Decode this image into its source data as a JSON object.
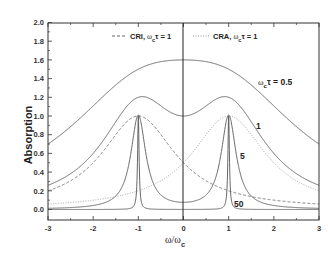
{
  "chart_data": {
    "type": "line",
    "title": "",
    "xlabel": "ω/ω_c",
    "ylabel": "Absorption",
    "xlim": [
      -3,
      3
    ],
    "ylim": [
      -0.1,
      2.0
    ],
    "grid": false,
    "x_ticks": [
      "-3",
      "-2",
      "-1",
      "0",
      "1",
      "2",
      "3"
    ],
    "y_ticks": [
      "0.0",
      "0.2",
      "0.4",
      "0.6",
      "0.8",
      "1.0",
      "1.2",
      "1.4",
      "1.6",
      "1.8",
      "2.0"
    ],
    "legend_position": "top",
    "legend": [
      {
        "label": "CRI, ωcτ = 1",
        "style": "dashed"
      },
      {
        "label": "CRA, ωcτ = 1",
        "style": "dotted"
      }
    ],
    "series": [
      {
        "name": "ωcτ = 0.5",
        "style": "solid",
        "tau": 0.5,
        "x": [
          -3,
          -2,
          -1,
          0,
          1,
          2,
          3
        ],
        "values": [
          0.69,
          1.02,
          1.49,
          1.6,
          1.49,
          1.02,
          0.69
        ]
      },
      {
        "name": "ωcτ = 1",
        "style": "solid",
        "tau": 1,
        "x": [
          -3,
          -2,
          -1,
          0,
          1,
          2,
          3
        ],
        "values": [
          0.26,
          0.6,
          1.2,
          1.0,
          1.2,
          0.6,
          0.26
        ]
      },
      {
        "name": "ωcτ = 5",
        "style": "solid",
        "tau": 5,
        "x": [
          -3,
          -2,
          -1,
          0,
          1,
          2,
          3
        ],
        "values": [
          0.012,
          0.044,
          1.01,
          0.077,
          1.01,
          0.044,
          0.012
        ]
      },
      {
        "name": "ωcτ = 50",
        "style": "solid",
        "tau": 50,
        "x": [
          -3,
          -2,
          -1,
          0,
          1,
          2,
          3
        ],
        "values": [
          0.0001,
          0.0004,
          1.0,
          0.0008,
          1.0,
          0.0004,
          0.0001
        ]
      },
      {
        "name": "CRI, ωcτ = 1",
        "style": "dashed",
        "tau": 1,
        "x": [
          -3,
          -2,
          -1,
          0,
          1,
          2,
          3
        ],
        "values": [
          0.2,
          0.5,
          1.0,
          0.5,
          0.2,
          0.1,
          0.06
        ]
      },
      {
        "name": "CRA, ωcτ = 1",
        "style": "dotted",
        "tau": 1,
        "x": [
          -3,
          -2,
          -1,
          0,
          1,
          2,
          3
        ],
        "values": [
          0.06,
          0.1,
          0.2,
          0.5,
          1.0,
          0.5,
          0.2
        ]
      }
    ],
    "annotations": [
      {
        "text": "ωcτ = 0.5",
        "x": 1.6,
        "y": 1.35
      },
      {
        "text": "1",
        "x": 1.55,
        "y": 0.87
      },
      {
        "text": "5",
        "x": 1.4,
        "y": 0.53
      },
      {
        "text": "50",
        "x": 1.3,
        "y": 0.11
      }
    ]
  },
  "labels": {
    "ylabel": "Absorption",
    "xlabel_omega": "ω/ω",
    "xlabel_sub": "c",
    "legend_cri": "CRI, ",
    "legend_cra": "CRA, ",
    "legend_omega": "ω",
    "legend_sub": "c",
    "legend_tau": "τ = 1",
    "ann_05_omega": "ω",
    "ann_05_sub": "c",
    "ann_05_rest": "τ = 0.5",
    "ann_1": "1",
    "ann_5": "5",
    "ann_50": "50"
  }
}
